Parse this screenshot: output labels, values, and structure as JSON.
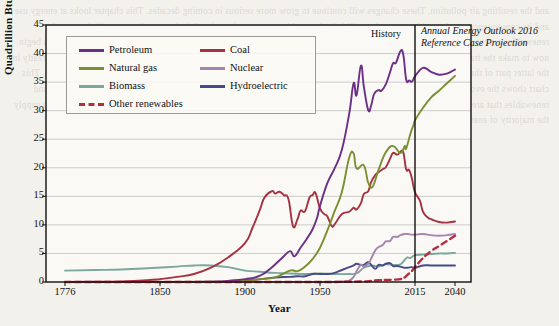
{
  "figure": {
    "annotations": {
      "history": "History",
      "projection_line1": "Annual Energy Outlook 2016",
      "projection_line2": "Reference Case Projection"
    }
  },
  "page_background_text": "and the resulting air pollution. These changes will continue to grow more serious in coming decades. This chapter looks at energy use and its consequences, and considers steps that will help the world move away from fossil fuels toward energy efficiency and renewable sources of energy. The United States and the world will continue to use fossil fuels for decades to come, but we can begin now to make the transition to a cleaner energy future. 11.1 Our Energy Sources Energy use in the United States has changed greatly in the latter part of the last two centuries. Figure 11.1 shows the dramatic increase in energy use during the Industrial Revolution. This chart shows the evolution of the fuels used in the United States, including the relatively recent introduction of nuclear power and renewables that are now meeting a growing share of our energy needs in the early twenty-first century. Fossil fuels continue to supply the majority of energy consumed in the United States.",
  "chart_data": {
    "type": "line",
    "title": "",
    "xlabel": "Year",
    "ylabel": "Quadrillion Btu",
    "xlim": [
      1776,
      2040
    ],
    "ylim": [
      0,
      45
    ],
    "ytick_values": [
      0,
      5,
      10,
      15,
      20,
      25,
      30,
      35,
      40,
      45
    ],
    "xtick_values": [
      1776,
      1850,
      1900,
      1950,
      2015,
      2040
    ],
    "xtick_labels": [
      "1776",
      "1850",
      "1900",
      "1950",
      "2015",
      "2040"
    ],
    "grid": "horizontal",
    "legend_position": "upper-left-inside",
    "history_projection_split_year": 2015,
    "colors": {
      "petroleum": "#6b2f86",
      "natural_gas": "#7a9030",
      "biomass": "#7ba79d",
      "other_renewables": "#b42f3e",
      "coal": "#a63241",
      "nuclear": "#a584b0",
      "hydroelectric": "#494b89"
    },
    "series": [
      {
        "name": "Petroleum",
        "color": "#6b2f86",
        "style": "solid",
        "points": [
          [
            1776,
            0
          ],
          [
            1850,
            0
          ],
          [
            1880,
            0.05
          ],
          [
            1890,
            0.2
          ],
          [
            1900,
            0.5
          ],
          [
            1910,
            1.1
          ],
          [
            1918,
            2.6
          ],
          [
            1925,
            4.3
          ],
          [
            1930,
            5.4
          ],
          [
            1933,
            4.5
          ],
          [
            1937,
            6.0
          ],
          [
            1941,
            7.5
          ],
          [
            1945,
            9.2
          ],
          [
            1948,
            11.2
          ],
          [
            1950,
            13.3
          ],
          [
            1955,
            17.3
          ],
          [
            1960,
            19.9
          ],
          [
            1965,
            23.2
          ],
          [
            1970,
            29.5
          ],
          [
            1973,
            34.8
          ],
          [
            1975,
            32.7
          ],
          [
            1978,
            37.9
          ],
          [
            1980,
            34.2
          ],
          [
            1983,
            30.1
          ],
          [
            1985,
            30.9
          ],
          [
            1987,
            32.9
          ],
          [
            1990,
            33.6
          ],
          [
            1992,
            33.5
          ],
          [
            1995,
            34.6
          ],
          [
            1998,
            36.8
          ],
          [
            2000,
            38.3
          ],
          [
            2002,
            38.4
          ],
          [
            2005,
            40.4
          ],
          [
            2007,
            39.8
          ],
          [
            2009,
            35.4
          ],
          [
            2011,
            35.3
          ],
          [
            2013,
            35.1
          ],
          [
            2015,
            36.0
          ],
          [
            2020,
            37.5
          ],
          [
            2025,
            36.8
          ],
          [
            2030,
            36.3
          ],
          [
            2035,
            36.5
          ],
          [
            2040,
            37.2
          ]
        ]
      },
      {
        "name": "Natural gas",
        "color": "#7a9030",
        "style": "solid",
        "points": [
          [
            1776,
            0
          ],
          [
            1880,
            0.05
          ],
          [
            1890,
            0.2
          ],
          [
            1900,
            0.25
          ],
          [
            1910,
            0.5
          ],
          [
            1920,
            0.8
          ],
          [
            1930,
            2.0
          ],
          [
            1935,
            1.9
          ],
          [
            1940,
            2.7
          ],
          [
            1945,
            4.0
          ],
          [
            1950,
            6.0
          ],
          [
            1955,
            9.0
          ],
          [
            1960,
            12.4
          ],
          [
            1965,
            15.8
          ],
          [
            1970,
            21.8
          ],
          [
            1973,
            22.5
          ],
          [
            1975,
            19.9
          ],
          [
            1980,
            20.4
          ],
          [
            1983,
            17.4
          ],
          [
            1986,
            16.7
          ],
          [
            1990,
            19.6
          ],
          [
            1995,
            22.7
          ],
          [
            2000,
            23.8
          ],
          [
            2005,
            22.6
          ],
          [
            2008,
            23.8
          ],
          [
            2009,
            23.4
          ],
          [
            2012,
            26.1
          ],
          [
            2014,
            27.5
          ],
          [
            2015,
            28.3
          ],
          [
            2020,
            30.5
          ],
          [
            2025,
            32.3
          ],
          [
            2030,
            33.5
          ],
          [
            2035,
            34.8
          ],
          [
            2040,
            36.1
          ]
        ]
      },
      {
        "name": "Biomass",
        "color": "#7ba79d",
        "style": "solid",
        "points": [
          [
            1776,
            2.0
          ],
          [
            1800,
            2.1
          ],
          [
            1820,
            2.2
          ],
          [
            1840,
            2.4
          ],
          [
            1860,
            2.7
          ],
          [
            1870,
            2.9
          ],
          [
            1880,
            2.9
          ],
          [
            1890,
            2.6
          ],
          [
            1900,
            2.0
          ],
          [
            1910,
            1.8
          ],
          [
            1920,
            1.6
          ],
          [
            1930,
            1.5
          ],
          [
            1940,
            1.4
          ],
          [
            1950,
            1.5
          ],
          [
            1960,
            1.4
          ],
          [
            1970,
            1.4
          ],
          [
            1975,
            1.5
          ],
          [
            1980,
            2.5
          ],
          [
            1985,
            2.9
          ],
          [
            1990,
            2.7
          ],
          [
            1995,
            3.1
          ],
          [
            2000,
            3.0
          ],
          [
            2005,
            3.1
          ],
          [
            2008,
            3.9
          ],
          [
            2010,
            4.3
          ],
          [
            2012,
            4.2
          ],
          [
            2015,
            4.7
          ],
          [
            2020,
            4.8
          ],
          [
            2025,
            4.9
          ],
          [
            2030,
            5.0
          ],
          [
            2035,
            5.0
          ],
          [
            2040,
            5.1
          ]
        ]
      },
      {
        "name": "Other renewables",
        "color": "#b42f3e",
        "style": "dashed",
        "points": [
          [
            1776,
            0
          ],
          [
            1900,
            0
          ],
          [
            1950,
            0
          ],
          [
            1960,
            0
          ],
          [
            1970,
            0.05
          ],
          [
            1980,
            0.1
          ],
          [
            1985,
            0.2
          ],
          [
            1990,
            0.3
          ],
          [
            1995,
            0.35
          ],
          [
            2000,
            0.4
          ],
          [
            2005,
            0.5
          ],
          [
            2008,
            0.8
          ],
          [
            2010,
            1.3
          ],
          [
            2012,
            1.7
          ],
          [
            2014,
            2.3
          ],
          [
            2015,
            2.6
          ],
          [
            2020,
            4.2
          ],
          [
            2025,
            5.4
          ],
          [
            2030,
            6.3
          ],
          [
            2035,
            7.2
          ],
          [
            2040,
            8.1
          ]
        ]
      },
      {
        "name": "Coal",
        "color": "#a63241",
        "style": "solid",
        "points": [
          [
            1776,
            0
          ],
          [
            1800,
            0.05
          ],
          [
            1820,
            0.1
          ],
          [
            1840,
            0.3
          ],
          [
            1850,
            0.5
          ],
          [
            1860,
            0.9
          ],
          [
            1870,
            1.4
          ],
          [
            1880,
            2.5
          ],
          [
            1890,
            4.3
          ],
          [
            1900,
            6.8
          ],
          [
            1905,
            9.5
          ],
          [
            1910,
            12.7
          ],
          [
            1913,
            14.8
          ],
          [
            1918,
            15.9
          ],
          [
            1920,
            15.5
          ],
          [
            1923,
            15.8
          ],
          [
            1926,
            15.2
          ],
          [
            1929,
            14.5
          ],
          [
            1932,
            9.8
          ],
          [
            1935,
            11.0
          ],
          [
            1937,
            12.5
          ],
          [
            1940,
            12.4
          ],
          [
            1943,
            14.8
          ],
          [
            1945,
            15.2
          ],
          [
            1947,
            15.6
          ],
          [
            1950,
            12.9
          ],
          [
            1953,
            11.9
          ],
          [
            1955,
            11.5
          ],
          [
            1958,
            9.8
          ],
          [
            1960,
            10.1
          ],
          [
            1965,
            11.9
          ],
          [
            1970,
            12.3
          ],
          [
            1973,
            13.0
          ],
          [
            1975,
            12.7
          ],
          [
            1978,
            13.8
          ],
          [
            1980,
            15.4
          ],
          [
            1983,
            15.9
          ],
          [
            1985,
            17.5
          ],
          [
            1988,
            18.8
          ],
          [
            1990,
            19.2
          ],
          [
            1993,
            19.8
          ],
          [
            1995,
            20.1
          ],
          [
            1998,
            21.6
          ],
          [
            2000,
            22.6
          ],
          [
            2003,
            22.3
          ],
          [
            2005,
            22.8
          ],
          [
            2007,
            22.7
          ],
          [
            2009,
            19.7
          ],
          [
            2011,
            19.6
          ],
          [
            2013,
            18.0
          ],
          [
            2015,
            15.7
          ],
          [
            2018,
            14.3
          ],
          [
            2020,
            12.3
          ],
          [
            2023,
            11.3
          ],
          [
            2025,
            11.0
          ],
          [
            2030,
            10.5
          ],
          [
            2035,
            10.4
          ],
          [
            2040,
            10.6
          ]
        ]
      },
      {
        "name": "Nuclear",
        "color": "#a584b0",
        "style": "solid",
        "points": [
          [
            1776,
            0
          ],
          [
            1950,
            0
          ],
          [
            1957,
            0.01
          ],
          [
            1960,
            0.05
          ],
          [
            1965,
            0.1
          ],
          [
            1970,
            0.24
          ],
          [
            1973,
            0.9
          ],
          [
            1975,
            1.9
          ],
          [
            1978,
            3.0
          ],
          [
            1980,
            2.7
          ],
          [
            1983,
            3.2
          ],
          [
            1985,
            4.1
          ],
          [
            1988,
            5.6
          ],
          [
            1990,
            6.1
          ],
          [
            1993,
            6.5
          ],
          [
            1995,
            7.1
          ],
          [
            1998,
            7.2
          ],
          [
            2000,
            7.9
          ],
          [
            2003,
            7.9
          ],
          [
            2005,
            8.2
          ],
          [
            2008,
            8.4
          ],
          [
            2010,
            8.4
          ],
          [
            2013,
            8.3
          ],
          [
            2015,
            8.3
          ],
          [
            2020,
            8.4
          ],
          [
            2025,
            8.2
          ],
          [
            2030,
            8.1
          ],
          [
            2035,
            8.2
          ],
          [
            2040,
            8.4
          ]
        ]
      },
      {
        "name": "Hydroelectric",
        "color": "#494b89",
        "style": "solid",
        "points": [
          [
            1776,
            0
          ],
          [
            1880,
            0
          ],
          [
            1890,
            0.05
          ],
          [
            1900,
            0.25
          ],
          [
            1910,
            0.5
          ],
          [
            1920,
            0.8
          ],
          [
            1930,
            0.9
          ],
          [
            1935,
            1.0
          ],
          [
            1940,
            1.0
          ],
          [
            1945,
            1.4
          ],
          [
            1950,
            1.4
          ],
          [
            1955,
            1.4
          ],
          [
            1960,
            1.6
          ],
          [
            1965,
            2.1
          ],
          [
            1970,
            2.6
          ],
          [
            1973,
            2.9
          ],
          [
            1975,
            3.2
          ],
          [
            1978,
            3.0
          ],
          [
            1980,
            3.0
          ],
          [
            1983,
            3.5
          ],
          [
            1985,
            3.0
          ],
          [
            1988,
            2.3
          ],
          [
            1990,
            3.0
          ],
          [
            1993,
            2.9
          ],
          [
            1995,
            3.2
          ],
          [
            1998,
            3.3
          ],
          [
            2000,
            2.8
          ],
          [
            2003,
            2.8
          ],
          [
            2005,
            2.7
          ],
          [
            2008,
            2.5
          ],
          [
            2010,
            2.5
          ],
          [
            2013,
            2.6
          ],
          [
            2015,
            2.5
          ],
          [
            2020,
            2.9
          ],
          [
            2025,
            2.9
          ],
          [
            2030,
            2.9
          ],
          [
            2035,
            2.9
          ],
          [
            2040,
            2.9
          ]
        ]
      }
    ],
    "legend": [
      {
        "label": "Petroleum",
        "color": "#6b2f86",
        "style": "solid",
        "col": 0,
        "row": 0
      },
      {
        "label": "Natural gas",
        "color": "#7a9030",
        "style": "solid",
        "col": 0,
        "row": 1
      },
      {
        "label": "Biomass",
        "color": "#7ba79d",
        "style": "solid",
        "col": 0,
        "row": 2
      },
      {
        "label": "Other renewables",
        "color": "#b42f3e",
        "style": "dashed",
        "col": 0,
        "row": 3
      },
      {
        "label": "Coal",
        "color": "#a63241",
        "style": "solid",
        "col": 1,
        "row": 0
      },
      {
        "label": "Nuclear",
        "color": "#a584b0",
        "style": "solid",
        "col": 1,
        "row": 1
      },
      {
        "label": "Hydroelectric",
        "color": "#494b89",
        "style": "solid",
        "col": 1,
        "row": 2
      }
    ]
  }
}
